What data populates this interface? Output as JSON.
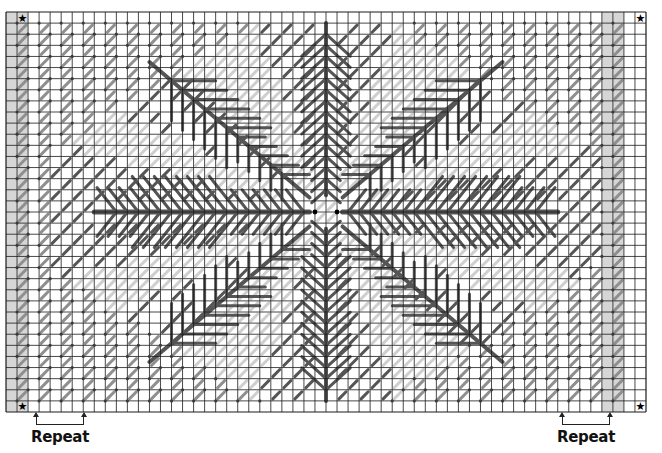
{
  "chart_data": {
    "type": "needlepoint-chart",
    "title": "",
    "grid": {
      "columns": 58,
      "rows": 36
    },
    "motif": "eight-armed snowflake",
    "colors": {
      "grid_line": "#1a1a1a",
      "background_stitch": "#8f8f8f",
      "light_stitch": "#cfcfcf",
      "dark_stitch": "#555555",
      "edge_shade": "#d6d6d6",
      "node": "#3a3a3a"
    },
    "markers": [
      {
        "symbol": "★",
        "corner": "top-left"
      },
      {
        "symbol": "★",
        "corner": "top-right"
      },
      {
        "symbol": "★",
        "corner": "bottom-left"
      },
      {
        "symbol": "★",
        "corner": "bottom-right"
      }
    ],
    "annotations": [
      {
        "text": "Repeat",
        "position": "bottom-left"
      },
      {
        "text": "Repeat",
        "position": "bottom-right"
      }
    ]
  },
  "labels": {
    "repeat_left": "Repeat",
    "repeat_right": "Repeat",
    "star": "★"
  }
}
